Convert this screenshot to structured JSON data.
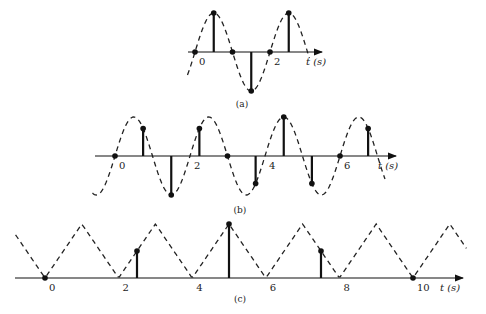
{
  "panels": [
    {
      "id": "a",
      "caption": "(a)",
      "axis_label": "t (s)",
      "tick_labels": [
        "0",
        "2"
      ],
      "ticks": [
        0,
        2
      ]
    },
    {
      "id": "b",
      "caption": "(b)",
      "axis_label": "t (s)",
      "tick_labels": [
        "0",
        "2",
        "4",
        "6"
      ],
      "ticks": [
        0,
        2,
        4,
        6
      ]
    },
    {
      "id": "c",
      "caption": "(c)",
      "axis_label": "t (s)",
      "tick_labels": [
        "0",
        "2",
        "4",
        "6",
        "8",
        "10"
      ],
      "ticks": [
        0,
        2,
        4,
        6,
        8,
        10
      ]
    }
  ],
  "chart_data": [
    {
      "type": "scatter",
      "title": "(a)",
      "xlabel": "t (s)",
      "ylabel": "",
      "continuous_signal": "sin(pi t), period 2 s (dashed)",
      "sample_interval": 0.5,
      "x": [
        0,
        0.5,
        1,
        1.5,
        2,
        2.5
      ],
      "values": [
        0,
        1,
        0,
        -1,
        0,
        1
      ],
      "xlim": [
        -0.1,
        3.2
      ],
      "ylim": [
        -1,
        1
      ]
    },
    {
      "type": "scatter",
      "title": "(b)",
      "xlabel": "t (s)",
      "ylabel": "",
      "continuous_signal": "sin(pi t), period 2 s (dashed)",
      "sample_interval": 0.75,
      "x": [
        0,
        0.75,
        1.5,
        2.25,
        3,
        3.75,
        4.5,
        5.25,
        6,
        6.75
      ],
      "values": [
        0,
        0.707,
        -1,
        0.707,
        0,
        -0.707,
        1,
        -0.707,
        0,
        0.707
      ],
      "xlim": [
        -0.6,
        7.5
      ],
      "ylim": [
        -1,
        1
      ]
    },
    {
      "type": "scatter",
      "title": "(c)",
      "xlabel": "t (s)",
      "ylabel": "",
      "continuous_signal": "triangle wave, period 2 s, peaks at odd t (dashed)",
      "sample_interval": 2.5,
      "x": [
        0,
        2.5,
        5,
        7.5,
        10
      ],
      "values": [
        0,
        0.5,
        1,
        0.5,
        0
      ],
      "xlim": [
        -0.8,
        11.5
      ],
      "ylim": [
        0,
        1
      ]
    }
  ]
}
